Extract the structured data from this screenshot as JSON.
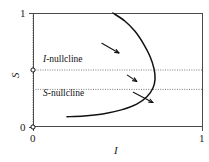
{
  "chart_data": {
    "type": "line",
    "title": "",
    "xlabel": "I",
    "ylabel": "S",
    "xlim": [
      0,
      1
    ],
    "ylim": [
      0,
      1
    ],
    "xticks": [
      0,
      1
    ],
    "xticklabels": [
      "0",
      "1"
    ],
    "yticks": [
      0,
      1
    ],
    "yticklabels": [
      "0",
      "1"
    ],
    "grid": false,
    "legend": "none",
    "annotations": [
      {
        "name": "I-nullcline",
        "text": "I-nullcline",
        "italic_prefix": "I",
        "rest": "-nullcline",
        "x": 0.06,
        "y": 0.54
      },
      {
        "name": "S-nullcline",
        "text": "S-nullcline",
        "italic_prefix": "S",
        "rest": "-nullcline",
        "x": 0.06,
        "y": 0.26
      }
    ],
    "series": [
      {
        "name": "S-nullcline-curve",
        "type": "line",
        "style": "solid",
        "color": "#111111",
        "points": [
          [
            0.47,
            1.0
          ],
          [
            0.54,
            0.93
          ],
          [
            0.6,
            0.84
          ],
          [
            0.65,
            0.73
          ],
          [
            0.688,
            0.62
          ],
          [
            0.712,
            0.51
          ],
          [
            0.718,
            0.42
          ],
          [
            0.705,
            0.34
          ],
          [
            0.67,
            0.265
          ],
          [
            0.61,
            0.2
          ],
          [
            0.52,
            0.15
          ],
          [
            0.41,
            0.115
          ],
          [
            0.3,
            0.097
          ],
          [
            0.2,
            0.09
          ]
        ]
      },
      {
        "name": "I-nullcline-horizontal",
        "type": "line",
        "style": "dotted",
        "color": "#555555",
        "points": [
          [
            0.0,
            0.5
          ],
          [
            1.0,
            0.5
          ]
        ]
      },
      {
        "name": "S-nullcline-horizontal",
        "type": "line",
        "style": "dotted",
        "color": "#555555",
        "points": [
          [
            0.0,
            0.33
          ],
          [
            1.0,
            0.33
          ]
        ]
      },
      {
        "name": "I-nullcline-vertical-axis",
        "type": "line",
        "style": "dotted",
        "color": "#555555",
        "points": [
          [
            0.0,
            0.0
          ],
          [
            0.0,
            1.0
          ]
        ]
      }
    ],
    "markers": [
      {
        "name": "equilibrium-upper",
        "x": 0.0,
        "y": 0.5,
        "style": "open-circle"
      },
      {
        "name": "equilibrium-origin",
        "x": 0.0,
        "y": 0.0,
        "style": "open-circle"
      }
    ],
    "direction_arrows": [
      {
        "name": "flow-arrow-upper",
        "x1": 0.405,
        "y1": 0.735,
        "x2": 0.505,
        "y2": 0.65
      },
      {
        "name": "flow-arrow-middle",
        "x1": 0.555,
        "y1": 0.455,
        "x2": 0.61,
        "y2": 0.4
      },
      {
        "name": "flow-arrow-on-curve",
        "x1": 0.59,
        "y1": 0.305,
        "x2": 0.705,
        "y2": 0.215
      }
    ]
  }
}
